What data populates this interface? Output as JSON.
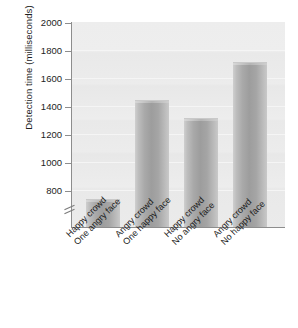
{
  "chart_data": {
    "type": "bar",
    "title": "",
    "xlabel": "",
    "ylabel": "Detection time (milliseconds)",
    "categories": [
      "Happy crowd One angry face",
      "Angry crowd One happy face",
      "Happy crowd No angry face",
      "Angry crowd No happy face"
    ],
    "category_lines": [
      [
        "Happy crowd",
        "One angry face"
      ],
      [
        "Angry crowd",
        "One happy face"
      ],
      [
        "Happy crowd",
        "No angry face"
      ],
      [
        "Angry crowd",
        "No happy face"
      ]
    ],
    "values": [
      875,
      1500,
      1390,
      1740
    ],
    "ylim": [
      700,
      2000
    ],
    "yticks": [
      800,
      1000,
      1200,
      1400,
      1600,
      1800,
      2000
    ],
    "axis_break": true,
    "grid": true,
    "legend": "none",
    "bar_color": "#a5a5a5",
    "plot_background": "#ebebeb"
  },
  "axis": {
    "y_title": "Detection time (milliseconds)",
    "tick_2000": "2000",
    "tick_1800": "1800",
    "tick_1600": "1600",
    "tick_1400": "1400",
    "tick_1200": "1200",
    "tick_1000": "1000",
    "tick_800": "800"
  },
  "bars": [
    {
      "line1": "Happy crowd",
      "line2": "One angry face",
      "value": 875
    },
    {
      "line1": "Angry crowd",
      "line2": "One happy face",
      "value": 1500
    },
    {
      "line1": "Happy crowd",
      "line2": "No angry face",
      "value": 1390
    },
    {
      "line1": "Angry crowd",
      "line2": "No happy face",
      "value": 1740
    }
  ]
}
